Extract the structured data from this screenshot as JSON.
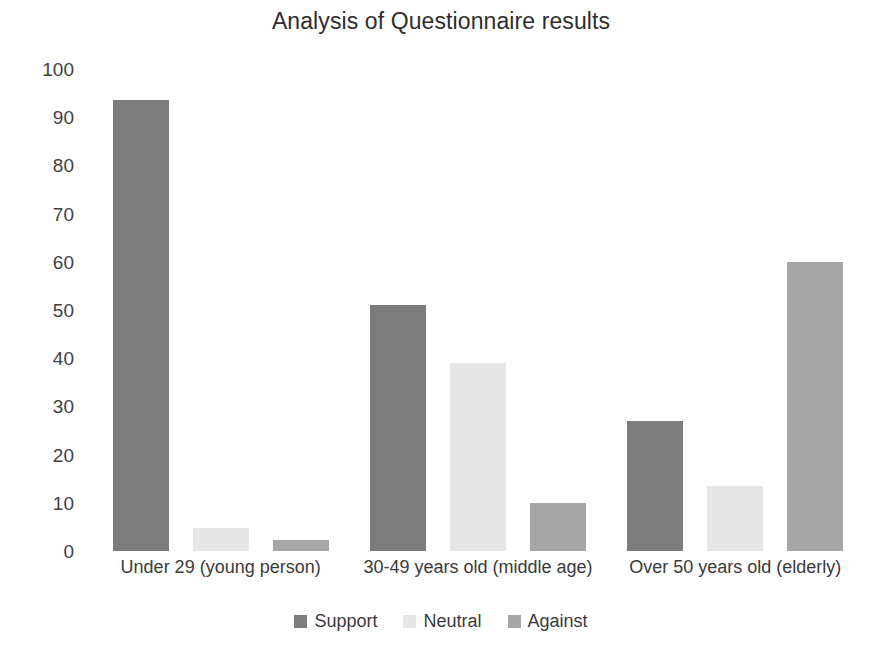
{
  "chart_data": {
    "type": "bar",
    "title": "Analysis of Questionnaire results",
    "xlabel": "",
    "ylabel": "",
    "ylim": [
      0,
      100
    ],
    "yticks": [
      100,
      90,
      80,
      70,
      60,
      50,
      40,
      30,
      20,
      10,
      0
    ],
    "grid": false,
    "legend_position": "bottom",
    "categories": [
      "Under 29 (young person)",
      "30-49 years old (middle age)",
      "Over 50 years old (elderly)"
    ],
    "series": [
      {
        "name": "Support",
        "color": "#7c7c7c",
        "values": [
          93.5,
          51,
          27
        ]
      },
      {
        "name": "Neutral",
        "color": "#e6e6e6",
        "values": [
          4.8,
          39,
          13.5
        ]
      },
      {
        "name": "Against",
        "color": "#a6a6a6",
        "values": [
          2.2,
          10,
          60
        ]
      }
    ]
  }
}
